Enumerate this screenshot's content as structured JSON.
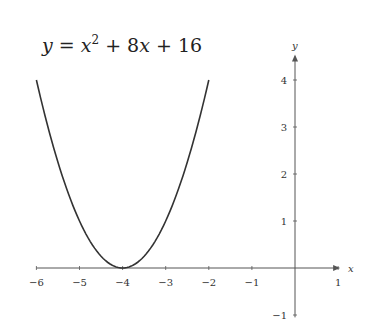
{
  "chart_data": {
    "type": "line",
    "title_parts": {
      "y": "y",
      "eq": " = ",
      "x1": "x",
      "sup": "2",
      "plus1": " + 8",
      "x2": "x",
      "plus2": " + 16"
    },
    "xlabel": "x",
    "ylabel": "y",
    "xlim": [
      -6,
      1
    ],
    "ylim": [
      -1,
      4.5
    ],
    "grid": false,
    "x_ticks": [
      -6,
      -5,
      -4,
      -3,
      -2,
      -1,
      1
    ],
    "x_tick_labels": [
      "−6",
      "−5",
      "−4",
      "−3",
      "−2",
      "−1",
      "1"
    ],
    "y_ticks": [
      -1,
      1,
      2,
      3,
      4
    ],
    "y_tick_labels": [
      "−1",
      "1",
      "2",
      "3",
      "4"
    ],
    "series": [
      {
        "name": "y = x^2 + 8x + 16",
        "domain": [
          -6,
          -2
        ],
        "x": [
          -6,
          -5.5,
          -5,
          -4.5,
          -4,
          -3.5,
          -3,
          -2.5,
          -2
        ],
        "values": [
          4,
          2.25,
          1,
          0.25,
          0,
          0.25,
          1,
          2.25,
          4
        ],
        "color": "#333333"
      }
    ]
  },
  "colors": {
    "axis": "#555555",
    "curve": "#333333",
    "background": "#ffffff"
  }
}
